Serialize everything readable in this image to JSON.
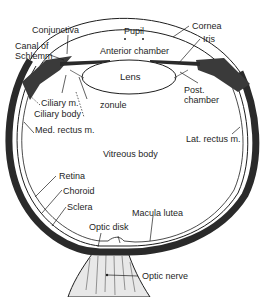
{
  "diagram": {
    "labels": {
      "conjunctiva": "Conjunctiva",
      "canal_of_schlemm_1": "Canal of",
      "canal_of_schlemm_2": "Schlemm",
      "pupil": "Pupil",
      "cornea": "Cornea",
      "iris": "Iris",
      "anterior_chamber": "Anterior chamber",
      "lens": "Lens",
      "ciliary_muscle": "Ciliary m.",
      "zonule": "zonule",
      "ciliary_body": "Ciliary body",
      "post_chamber_1": "Post.",
      "post_chamber_2": "chamber",
      "med_rectus": "Med. rectus m.",
      "lat_rectus": "Lat. rectus m.",
      "vitreous_body": "Vitreous body",
      "retina": "Retina",
      "choroid": "Choroid",
      "sclera": "Sclera",
      "macula_lutea": "Macula lutea",
      "optic_disk": "Optic disk",
      "optic_nerve": "Optic nerve"
    },
    "colors": {
      "ink": "#1e1e1e",
      "sclera_fill": "#2a2a2a",
      "background": "#ffffff"
    }
  }
}
